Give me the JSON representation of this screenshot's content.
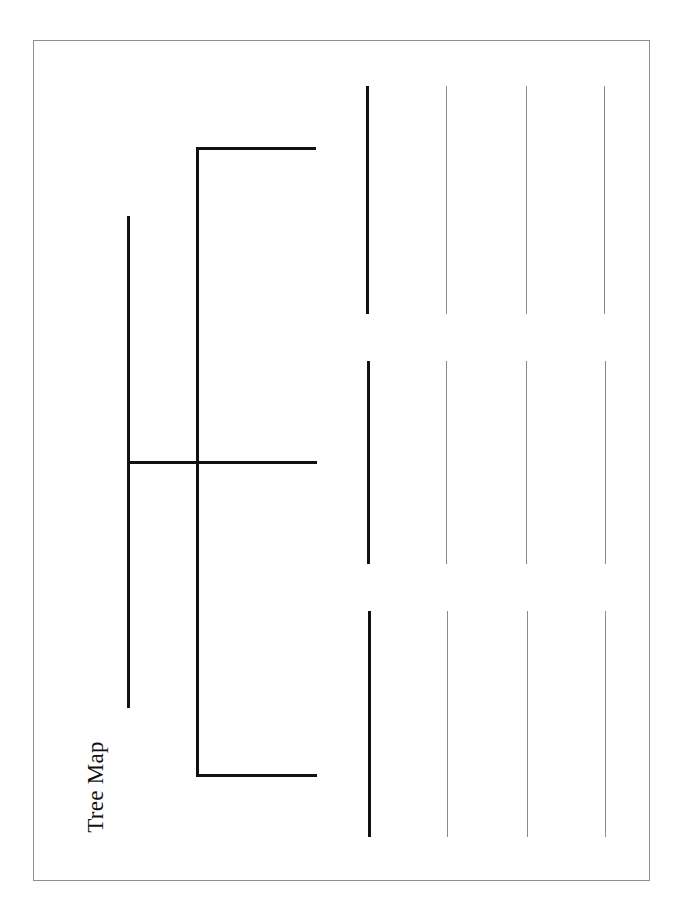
{
  "worksheet": {
    "title": "Tree Map",
    "colors": {
      "frame_border": "#8f8f8f",
      "structure_lines": "#111111",
      "writing_lines": "#8a8a8a",
      "background": "#ffffff"
    },
    "branches": [
      {
        "label": "",
        "writing_lines": 3
      },
      {
        "label": "",
        "writing_lines": 3
      },
      {
        "label": "",
        "writing_lines": 3
      }
    ]
  }
}
